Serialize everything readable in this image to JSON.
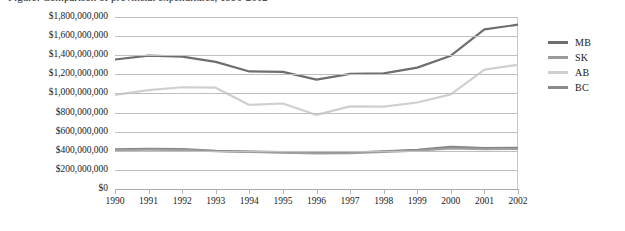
{
  "caption": {
    "text": "Figure: Comparison of provincial expenditures, 1990-2002"
  },
  "chart_data": {
    "type": "line",
    "title": "",
    "xlabel": "",
    "ylabel": "",
    "x": [
      1990,
      1991,
      1992,
      1993,
      1994,
      1995,
      1996,
      1997,
      1998,
      1999,
      2000,
      2001,
      2002
    ],
    "categories": [
      "1990",
      "1991",
      "1992",
      "1993",
      "1994",
      "1995",
      "1996",
      "1997",
      "1998",
      "1999",
      "2000",
      "2001",
      "2002"
    ],
    "ylim": [
      0,
      1800000000
    ],
    "ytick_values": [
      0,
      200000000,
      400000000,
      600000000,
      800000000,
      1000000000,
      1200000000,
      1400000000,
      1600000000,
      1800000000
    ],
    "ytick_labels": [
      "$0",
      "$200,000,000",
      "$400,000,000",
      "$600,000,000",
      "$800,000,000",
      "$1,000,000,000",
      "$1,200,000,000",
      "$1,400,000,000",
      "$1,600,000,000",
      "$1,800,000,000"
    ],
    "grid": true,
    "legend_position": "right",
    "series": [
      {
        "name": "MB",
        "color": "#7f7f7f",
        "values": [
          415000000,
          420000000,
          418000000,
          400000000,
          392000000,
          385000000,
          378000000,
          382000000,
          395000000,
          410000000,
          440000000,
          428000000,
          430000000
        ]
      },
      {
        "name": "SK",
        "color": "#9e9e9e",
        "values": [
          408000000,
          412000000,
          410000000,
          395000000,
          388000000,
          380000000,
          372000000,
          376000000,
          388000000,
          402000000,
          425000000,
          418000000,
          420000000
        ]
      },
      {
        "name": "AB",
        "color": "#cfcfcf",
        "values": [
          985000000,
          1035000000,
          1065000000,
          1060000000,
          880000000,
          895000000,
          775000000,
          865000000,
          862000000,
          905000000,
          990000000,
          1250000000,
          1300000000
        ]
      },
      {
        "name": "BC",
        "color": "#6e6e6e",
        "values": [
          1355000000,
          1395000000,
          1385000000,
          1330000000,
          1230000000,
          1225000000,
          1145000000,
          1205000000,
          1210000000,
          1270000000,
          1395000000,
          1670000000,
          1720000000
        ]
      }
    ]
  },
  "legend": {
    "items": [
      {
        "label": "MB",
        "color": "#6e6e6e"
      },
      {
        "label": "SK",
        "color": "#9a9a9a"
      },
      {
        "label": "AB",
        "color": "#cfcfcf"
      },
      {
        "label": "BC",
        "color": "#8a8a8a"
      }
    ]
  }
}
